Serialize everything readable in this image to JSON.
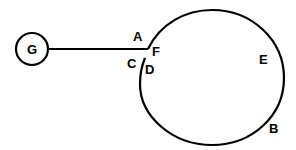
{
  "diagram": {
    "node_g": {
      "label": "G"
    },
    "labels": {
      "a": "A",
      "b": "B",
      "c": "C",
      "d": "D",
      "e": "E",
      "f": "F"
    },
    "colors": {
      "stroke": "#000000",
      "background": "#ffffff"
    }
  }
}
